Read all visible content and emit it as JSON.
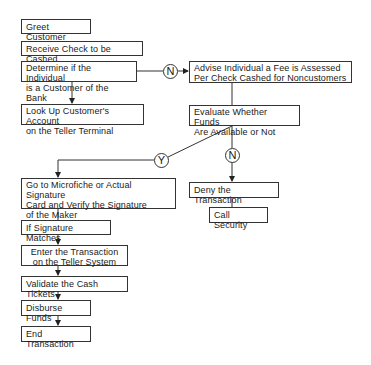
{
  "diagram": {
    "type": "flowchart",
    "nodes": {
      "greet": "Greet Customer",
      "receive": "Receive Check to be Cashed",
      "determine": "Determine if the Individual\nis a Customer of the Bank",
      "advise": "Advise Individual a Fee is Assessed\nPer Check Cashed for Noncustomers",
      "lookup": "Look Up Customer's Account\non the Teller Terminal",
      "evaluate": "Evaluate Whether Funds\nAre Available or Not",
      "microfiche": "Go to Microfiche or Actual Signature\nCard and Verify the Signature\nof the Maker",
      "deny": "Deny the Transaction",
      "security": "Call Security",
      "sigmatch": "If Signature Matches",
      "enter": "Enter the Transaction\non the Teller System",
      "validate": "Validate the Cash Tickets",
      "disburse": "Disburse Funds",
      "end": "End Transaction"
    },
    "decisions": {
      "customer_no": "N",
      "funds_yes": "Y",
      "funds_no": "N"
    },
    "edges": [
      {
        "from": "determine",
        "to": "advise",
        "label": "N"
      },
      {
        "from": "determine",
        "to": "lookup"
      },
      {
        "from": "advise",
        "to": "evaluate"
      },
      {
        "from": "evaluate",
        "to": "microfiche",
        "label": "Y"
      },
      {
        "from": "evaluate",
        "to": "deny",
        "label": "N"
      },
      {
        "from": "deny",
        "to": "security"
      },
      {
        "from": "microfiche",
        "to": "sigmatch"
      },
      {
        "from": "sigmatch",
        "to": "enter"
      },
      {
        "from": "enter",
        "to": "validate"
      },
      {
        "from": "validate",
        "to": "disburse"
      },
      {
        "from": "disburse",
        "to": "end"
      }
    ]
  }
}
